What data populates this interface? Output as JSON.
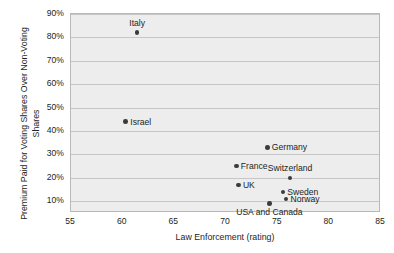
{
  "chart_data": {
    "type": "scatter",
    "title": "",
    "xlabel": "Law Enforcement (rating)",
    "ylabel": "Premium Paid for Voting Shares Over Non-Voting Shares",
    "xlim": [
      55,
      85
    ],
    "ylim": [
      5,
      90
    ],
    "xticks": [
      "55",
      "60",
      "65",
      "70",
      "75",
      "80",
      "85"
    ],
    "xtick_values": [
      55,
      60,
      65,
      70,
      75,
      80,
      85
    ],
    "yticks": [
      "10%",
      "20%",
      "30%",
      "40%",
      "50%",
      "60%",
      "70%",
      "80%",
      "90%"
    ],
    "ytick_values": [
      10,
      20,
      30,
      40,
      50,
      60,
      70,
      80,
      90
    ],
    "grid": "horizontal",
    "legend": "none",
    "marker_color": "#3b3b3b",
    "plot_background": "#ededed",
    "gridline_color": "#c6c6c6",
    "border_color": "#b9b9b9",
    "points": [
      {
        "name": "Italy",
        "x": 61.4,
        "y": 82,
        "label_pos": "above"
      },
      {
        "name": "Israel",
        "x": 60.3,
        "y": 44,
        "label_pos": "right"
      },
      {
        "name": "Germany",
        "x": 74.0,
        "y": 33,
        "label_pos": "right"
      },
      {
        "name": "France",
        "x": 71.0,
        "y": 25,
        "label_pos": "right"
      },
      {
        "name": "Switzerland",
        "x": 76.2,
        "y": 20,
        "label_pos": "above"
      },
      {
        "name": "UK",
        "x": 71.2,
        "y": 17,
        "label_pos": "right"
      },
      {
        "name": "Sweden",
        "x": 75.5,
        "y": 14,
        "label_pos": "right"
      },
      {
        "name": "Norway",
        "x": 75.8,
        "y": 11,
        "label_pos": "right"
      },
      {
        "name": "USA and Canada",
        "x": 74.2,
        "y": 9,
        "label_pos": "below"
      }
    ]
  }
}
